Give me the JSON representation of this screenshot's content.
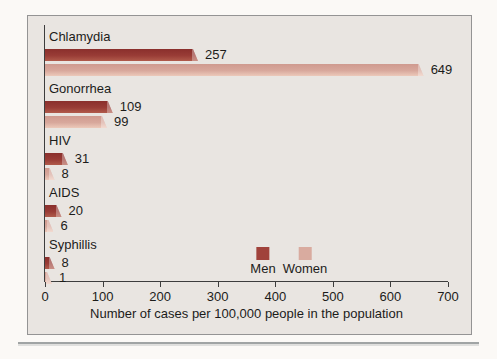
{
  "figure": {
    "panel_background": "#e9e5e1",
    "panel_border_color": "#949494",
    "axis_color": "#3d3d3d"
  },
  "chart_data": {
    "type": "bar",
    "orientation": "horizontal",
    "title": "",
    "categories": [
      "Chlamydia",
      "Gonorrhea",
      "HIV",
      "AIDS",
      "Syphillis"
    ],
    "series": [
      {
        "name": "Men",
        "values": [
          257,
          109,
          31,
          20,
          8
        ],
        "color_top": "#8a2f2c",
        "color_mid": "#993c36",
        "color_bottom": "#b05a4b",
        "legend_color": "#a0423b"
      },
      {
        "name": "Women",
        "values": [
          649,
          99,
          8,
          6,
          1
        ],
        "color_top": "#cf9a8f",
        "color_mid": "#d8a89c",
        "color_bottom": "#ecc9ba",
        "legend_color": "#d9ab9f"
      }
    ],
    "xlabel": "Number of cases per 100,000 people in the population",
    "ylabel": "",
    "x_ticks": [
      0,
      100,
      200,
      300,
      400,
      500,
      600,
      700
    ],
    "xlim": [
      0,
      700
    ],
    "grid": false,
    "legend_position": "inside-bottom-center",
    "value_labels_shown": true
  }
}
